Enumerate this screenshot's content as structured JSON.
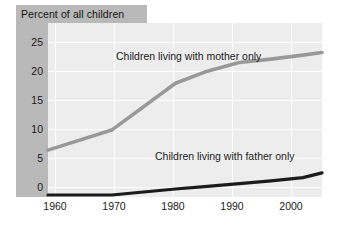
{
  "title": "Percent of all children",
  "axes": {
    "y_ticks": [
      "25",
      "20",
      "15",
      "10",
      "5",
      "0"
    ],
    "x_ticks": [
      "1960",
      "1970",
      "1980",
      "1990",
      "2000"
    ]
  },
  "labels": {
    "mother": "Children living with mother only",
    "father": "Children living with father only"
  },
  "colors": {
    "mother_line": "#999999",
    "father_line": "#1c1c1c",
    "plot_background": "#ededed",
    "panel_background": "#b9b9b9",
    "gridline": "#ffffff",
    "text": "#1a1a1a"
  },
  "chart_data": {
    "type": "line",
    "title": "Percent of all children",
    "xlabel": "",
    "ylabel": "Percent of all children",
    "xlim": [
      1960,
      2003
    ],
    "ylim": [
      0,
      26
    ],
    "yticks": [
      0,
      5,
      10,
      15,
      20,
      25
    ],
    "xticks": [
      1960,
      1970,
      1980,
      1990,
      2000
    ],
    "grid": true,
    "legend": "inline-annotations",
    "series": [
      {
        "name": "Children living with mother only",
        "color": "#999999",
        "x": [
          1960,
          1970,
          1980,
          1985,
          1990,
          1995,
          2000,
          2003
        ],
        "values": [
          7.0,
          10.0,
          17.0,
          18.8,
          20.1,
          20.6,
          21.2,
          21.6
        ]
      },
      {
        "name": "Children living with father only",
        "color": "#1c1c1c",
        "x": [
          1960,
          1970,
          1980,
          1985,
          1990,
          1995,
          2000,
          2003
        ],
        "values": [
          0.3,
          0.3,
          1.2,
          1.6,
          2.0,
          2.4,
          2.9,
          3.6
        ]
      }
    ]
  }
}
